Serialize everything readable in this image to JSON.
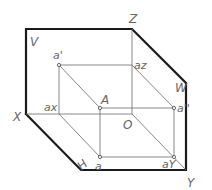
{
  "diagram": {
    "planes": {
      "V": "V",
      "H": "H",
      "W": "W"
    },
    "axes": {
      "X": "X",
      "Y": "Y",
      "Z": "Z",
      "origin": "O"
    },
    "points": {
      "A": "A",
      "a": "a",
      "a_prime": "a'",
      "a_double_prime": "a''",
      "a_x": "ax",
      "a_y": "aY",
      "a_z": "az"
    },
    "colors": {
      "thick_line": "#1a1a1a",
      "thin_line": "#7a7a7a",
      "label": "#666666",
      "background": "#ffffff"
    }
  }
}
